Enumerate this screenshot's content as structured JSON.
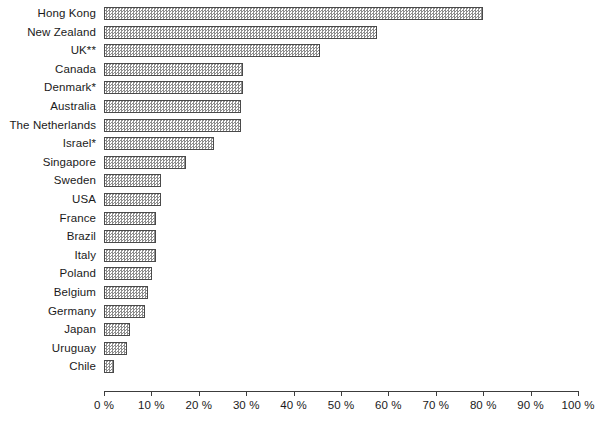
{
  "chart_data": {
    "type": "bar",
    "orientation": "horizontal",
    "title": "",
    "subtitle": "",
    "xlabel": "",
    "ylabel": "",
    "xlim": [
      0,
      100
    ],
    "grid": false,
    "legend": null,
    "axis_tick_suffix": " %",
    "categories": [
      "Hong Kong",
      "New Zealand",
      "UK**",
      "Canada",
      "Denmark*",
      "Australia",
      "The Netherlands",
      "Israel*",
      "Singapore",
      "Sweden",
      "USA",
      "France",
      "Brazil",
      "Italy",
      "Poland",
      "Belgium",
      "Germany",
      "Japan",
      "Uruguay",
      "Chile"
    ],
    "values": [
      80.0,
      57.5,
      45.5,
      29.3,
      29.3,
      28.9,
      28.9,
      23.2,
      17.3,
      12.0,
      12.0,
      11.0,
      11.0,
      11.0,
      10.1,
      9.3,
      8.6,
      5.5,
      4.9,
      2.1
    ],
    "xticks": [
      0,
      10,
      20,
      30,
      40,
      50,
      60,
      70,
      80,
      90,
      100
    ],
    "xtick_labels": [
      "0 %",
      "10 %",
      "20 %",
      "30 %",
      "40 %",
      "50 %",
      "60 %",
      "70 %",
      "80 %",
      "90 %",
      "100 %"
    ],
    "bar_fill": "#8d8d8d",
    "bar_pattern": "checkerboard-hatch",
    "bar_edge_color": "#4a4a4a",
    "axis_color": "#3c3c3c",
    "text_color": "#1a1a1a",
    "background": "#ffffff"
  }
}
